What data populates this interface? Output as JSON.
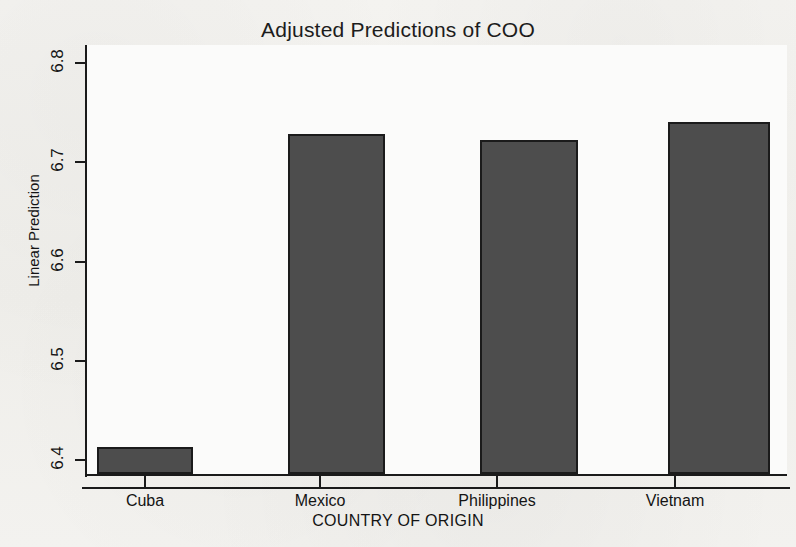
{
  "chart_data": {
    "type": "bar",
    "title": "Adjusted Predictions of COO",
    "xlabel": "COUNTRY OF ORIGIN",
    "ylabel": "Linear Prediction",
    "categories": [
      "Cuba",
      "Mexico",
      "Philippines",
      "Vietnam"
    ],
    "values": [
      6.413,
      6.728,
      6.722,
      6.741
    ],
    "ylim": [
      6.4,
      6.8
    ],
    "yticks": [
      "6.4",
      "6.5",
      "6.6",
      "6.7",
      "6.8"
    ],
    "ytick_values": [
      6.4,
      6.5,
      6.6,
      6.7,
      6.8
    ],
    "grid": false,
    "legend": null,
    "bar_color": "#4d4d4d",
    "bar_outline_color": "#1b1b1b",
    "axis_color": "#1a1a1a",
    "background_color": "#f2f1ee",
    "plot_background_color": "#fbfbfa"
  }
}
